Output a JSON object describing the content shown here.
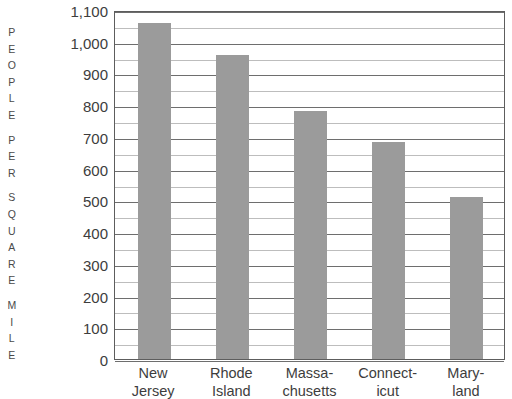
{
  "chart_data": {
    "type": "bar",
    "title": "",
    "subtitle": "",
    "xlabel": "",
    "ylabel": "PEOPLE PER SQUARE MILE",
    "ylabel_letters": [
      "P",
      "E",
      "O",
      "P",
      "L",
      "E",
      "",
      "P",
      "E",
      "R",
      "",
      "S",
      "Q",
      "U",
      "A",
      "R",
      "E",
      "",
      "M",
      "I",
      "L",
      "E"
    ],
    "categories": [
      "New Jersey",
      "Rhode Island",
      "Massachusetts",
      "Connecticut",
      "Maryland"
    ],
    "category_lines": [
      [
        "New",
        "Jersey"
      ],
      [
        "Rhode",
        "Island"
      ],
      [
        "Massa-",
        "chusetts"
      ],
      [
        "Connect-",
        "icut"
      ],
      [
        "Mary-",
        "land"
      ]
    ],
    "values": [
      1060,
      957,
      782,
      685,
      510
    ],
    "ylim": [
      0,
      1100
    ],
    "ytick_values": [
      0,
      100,
      200,
      300,
      400,
      500,
      600,
      700,
      800,
      900,
      1000,
      1100
    ],
    "ytick_labels": [
      "0",
      "100",
      "200",
      "300",
      "400",
      "500",
      "600",
      "700",
      "800",
      "900",
      "1,000",
      "1,100"
    ],
    "gridline_interval": 50,
    "grid": true,
    "legend": "none",
    "bar_color": "#9b9b9b",
    "frame_color": "#5d5d5d",
    "major_gridline_color": "#6e6e6e",
    "minor_gridline_color": "#bdbdbd",
    "text_color": "#3d3d3d",
    "background_color": "#ffffff"
  }
}
